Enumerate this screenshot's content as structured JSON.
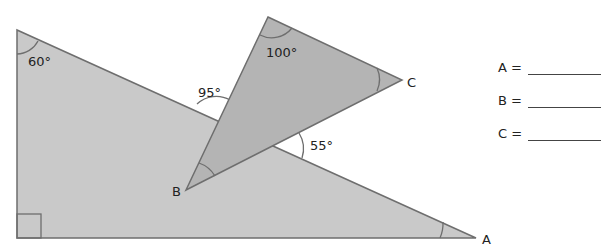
{
  "diagram": {
    "big_triangle": {
      "angle_top_left": "60°",
      "right_angle_marker": true,
      "vertex_label": "A"
    },
    "small_triangle": {
      "angle_top": "100°",
      "vertex_labels": [
        "B",
        "C"
      ]
    },
    "exterior_angles": [
      "95°",
      "55°"
    ],
    "colors": {
      "big_fill": "#c9c9c9",
      "small_fill": "#b4b4b4",
      "stroke": "#6e6e6e"
    }
  },
  "answers": [
    {
      "label": "A =",
      "value": ""
    },
    {
      "label": "B =",
      "value": ""
    },
    {
      "label": "C =",
      "value": ""
    }
  ]
}
